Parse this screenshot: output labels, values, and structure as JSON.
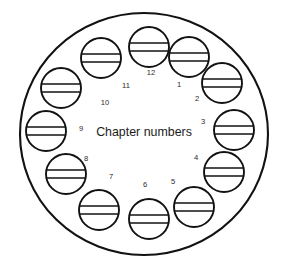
{
  "diagram": {
    "title": "Chapter numbers",
    "type": "clock-face",
    "center_label": "Chapter numbers",
    "colors": {
      "stroke": "#121212",
      "fill": "#ffffff",
      "number_text": "#2b2b2b",
      "caption_text": "#1c1c1c",
      "background": "#ffffff"
    },
    "outer_shape": {
      "kind": "ellipse",
      "cx": 144,
      "cy": 134,
      "rx": 124,
      "ry": 121
    },
    "center_text_position": {
      "x": 144,
      "y": 133
    },
    "positions": [
      {
        "label": "12",
        "hour": 12,
        "number_x": 151,
        "number_y": 73,
        "circle_cx": 149,
        "circle_cy": 47,
        "circle_r": 20
      },
      {
        "label": "1",
        "hour": 1,
        "number_x": 179,
        "number_y": 85,
        "circle_cx": 189,
        "circle_cy": 57,
        "circle_r": 20
      },
      {
        "label": "2",
        "hour": 2,
        "number_x": 197,
        "number_y": 99,
        "circle_cx": 222,
        "circle_cy": 83,
        "circle_r": 20
      },
      {
        "label": "3",
        "hour": 3,
        "number_x": 203,
        "number_y": 122,
        "circle_cx": 234,
        "circle_cy": 130,
        "circle_r": 20
      },
      {
        "label": "4",
        "hour": 4,
        "number_x": 196,
        "number_y": 158,
        "circle_cx": 224,
        "circle_cy": 172,
        "circle_r": 20
      },
      {
        "label": "5",
        "hour": 5,
        "number_x": 173,
        "number_y": 182,
        "circle_cx": 194,
        "circle_cy": 207,
        "circle_r": 20
      },
      {
        "label": "6",
        "hour": 6,
        "number_x": 145,
        "number_y": 185,
        "circle_cx": 149,
        "circle_cy": 219,
        "circle_r": 20
      },
      {
        "label": "7",
        "hour": 7,
        "number_x": 111,
        "number_y": 177,
        "circle_cx": 99,
        "circle_cy": 210,
        "circle_r": 20
      },
      {
        "label": "8",
        "hour": 8,
        "number_x": 86,
        "number_y": 159,
        "circle_cx": 66,
        "circle_cy": 174,
        "circle_r": 20
      },
      {
        "label": "9",
        "hour": 9,
        "number_x": 81,
        "number_y": 129,
        "circle_cx": 46,
        "circle_cy": 131,
        "circle_r": 20
      },
      {
        "label": "10",
        "hour": 10,
        "number_x": 105,
        "number_y": 103,
        "circle_cx": 61,
        "circle_cy": 88,
        "circle_r": 20
      },
      {
        "label": "11",
        "hour": 11,
        "number_x": 126,
        "number_y": 86,
        "circle_cx": 101,
        "circle_cy": 58,
        "circle_r": 20
      }
    ],
    "token_line_offsets": [
      -4,
      4
    ]
  }
}
